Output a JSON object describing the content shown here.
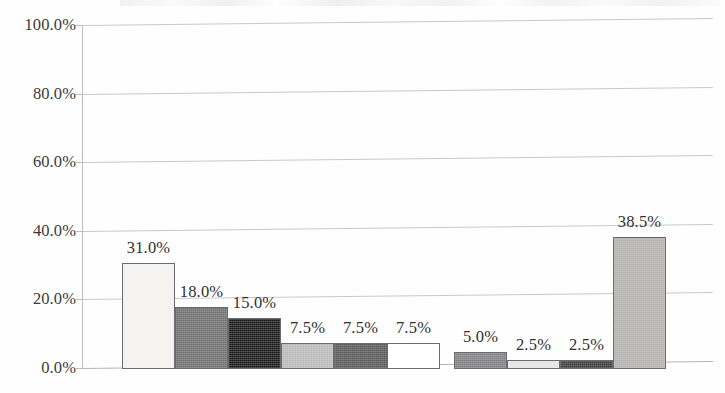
{
  "chart_data": {
    "type": "bar",
    "title": "",
    "subtitle": "",
    "xlabel": "",
    "ylabel": "",
    "ylim": [
      0,
      100
    ],
    "yticks": [
      "0.0%",
      "20.0%",
      "40.0%",
      "60.0%",
      "80.0%",
      "100.0%"
    ],
    "ytick_values": [
      0,
      20,
      40,
      60,
      80,
      100
    ],
    "grid": true,
    "legend": "none",
    "categories": [
      "",
      "",
      "",
      "",
      "",
      "",
      "",
      "",
      "",
      ""
    ],
    "values": [
      31.0,
      18.0,
      15.0,
      7.5,
      7.5,
      7.5,
      5.0,
      2.5,
      2.5,
      38.5
    ],
    "data_labels": [
      "31.0%",
      "18.0%",
      "15.0%",
      "7.5%",
      "7.5%",
      "7.5%",
      "5.0%",
      "2.5%",
      "2.5%",
      "38.5%"
    ],
    "bar_colors": [
      "#f2f1ee",
      "#6f6f70",
      "#1b1b1c",
      "#b9b9ba",
      "#585859",
      "#ffffff",
      "#808082",
      "#e4e3e1",
      "#3c3c3e",
      "#b3b2b1"
    ],
    "bar_border_color": "#6b6b6d",
    "grid_color": "#c9c9cb",
    "axis_color": "#bdbdbf",
    "background": "#fefefe",
    "text_color": "#303032"
  },
  "bars": [
    {
      "label": "31.0%",
      "value": 31.0,
      "color": "#f2f1ee",
      "x": 40,
      "width": 53
    },
    {
      "label": "18.0%",
      "value": 18.0,
      "color": "#6f6f70",
      "x": 93,
      "width": 53
    },
    {
      "label": "15.0%",
      "value": 15.0,
      "color": "#1b1b1c",
      "x": 146,
      "width": 53
    },
    {
      "label": "7.5%",
      "value": 7.5,
      "color": "#b9b9ba",
      "x": 199,
      "width": 53
    },
    {
      "label": "7.5%",
      "value": 7.5,
      "color": "#585859",
      "x": 252,
      "width": 53
    },
    {
      "label": "7.5%",
      "value": 7.5,
      "color": "#ffffff",
      "x": 305,
      "width": 53
    },
    {
      "label": "5.0%",
      "value": 5.0,
      "color": "#808082",
      "x": 372,
      "width": 53
    },
    {
      "label": "2.5%",
      "value": 2.5,
      "color": "#e4e3e1",
      "x": 425,
      "width": 53
    },
    {
      "label": "2.5%",
      "value": 2.5,
      "color": "#3c3c3e",
      "x": 478,
      "width": 53
    },
    {
      "label": "38.5%",
      "value": 38.5,
      "color": "#b3b2b1",
      "x": 531,
      "width": 53
    }
  ],
  "y_axis": {
    "ticks": [
      {
        "label": "100.0%",
        "value": 100
      },
      {
        "label": "80.0%",
        "value": 80
      },
      {
        "label": "60.0%",
        "value": 60
      },
      {
        "label": "40.0%",
        "value": 40
      },
      {
        "label": "20.0%",
        "value": 20
      },
      {
        "label": "0.0%",
        "value": 0
      }
    ]
  }
}
